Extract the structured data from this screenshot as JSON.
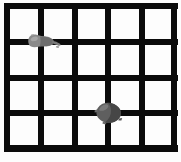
{
  "image": {
    "title": "Grid with two gray blobs",
    "width": 181,
    "height": 162,
    "background_color": "#fdfdfd",
    "line_color": "#0b0b0b"
  },
  "grid": {
    "columns": 5,
    "rows": 4,
    "line_thickness_px": 6,
    "vertical_line_x": [
      7,
      41,
      75,
      108,
      142,
      174
    ],
    "horizontal_line_y": [
      6,
      42,
      78,
      113,
      148
    ],
    "border_color": "#0b0b0b"
  },
  "blobs": [
    {
      "name": "blob-upper-left",
      "center_x": 41,
      "center_y": 42,
      "width": 30,
      "height": 17,
      "fill_color": "#8a8a8a",
      "shade_color": "#6e6e6e",
      "shape": "elongated-irregular",
      "grid_cell": "row 1-2, column 1-2 intersection"
    },
    {
      "name": "blob-lower-center",
      "center_x": 108,
      "center_y": 113,
      "width": 26,
      "height": 22,
      "fill_color": "#5f5f5f",
      "shade_color": "#464646",
      "shape": "rounded-irregular",
      "grid_cell": "row 3-4, column 3-4 intersection"
    }
  ]
}
